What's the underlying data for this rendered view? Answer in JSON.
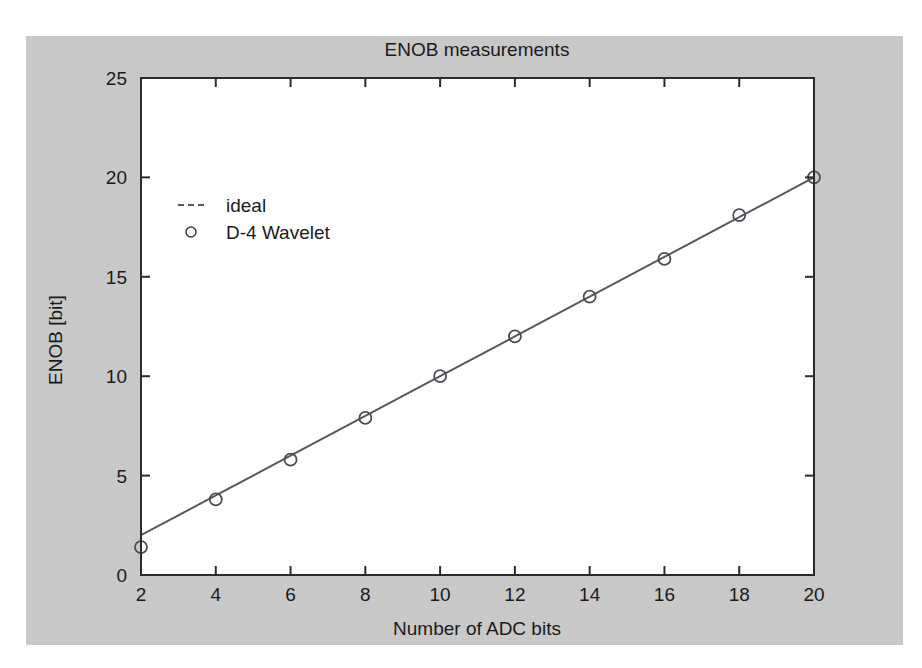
{
  "figure": {
    "background_color": "#c8c8c8",
    "plot_background_color": "#ffffff",
    "frame_color": "#2b2b2b",
    "series_color": "#55585e"
  },
  "chart_data": {
    "type": "line",
    "title": "ENOB measurements",
    "xlabel": "Number of ADC bits",
    "ylabel": "ENOB [bit]",
    "xlim": [
      2,
      20
    ],
    "ylim": [
      0,
      25
    ],
    "xticks": [
      2,
      4,
      6,
      8,
      10,
      12,
      14,
      16,
      18,
      20
    ],
    "yticks": [
      0,
      5,
      10,
      15,
      20,
      25
    ],
    "xtick_labels": [
      "2",
      "4",
      "6",
      "8",
      "10",
      "12",
      "14",
      "16",
      "18",
      "20"
    ],
    "ytick_labels": [
      "0",
      "5",
      "10",
      "15",
      "20",
      "25"
    ],
    "grid": false,
    "legend_position": "upper left",
    "series": [
      {
        "name": "ideal",
        "marker": "dashed-line",
        "x": [
          2,
          4,
          6,
          8,
          10,
          12,
          14,
          16,
          18,
          20
        ],
        "values": [
          2,
          4,
          6,
          8,
          10,
          12,
          14,
          16,
          18,
          20
        ]
      },
      {
        "name": "D-4 Wavelet",
        "marker": "circle",
        "x": [
          2,
          4,
          6,
          8,
          10,
          12,
          14,
          16,
          18,
          20
        ],
        "values": [
          1.4,
          3.8,
          5.8,
          7.9,
          10.0,
          12.0,
          14.0,
          15.9,
          18.1,
          20.0
        ]
      }
    ]
  },
  "legend": {
    "entries": [
      {
        "label": "ideal",
        "marker": "dashed-line"
      },
      {
        "label": "D-4 Wavelet",
        "marker": "circle"
      }
    ]
  }
}
